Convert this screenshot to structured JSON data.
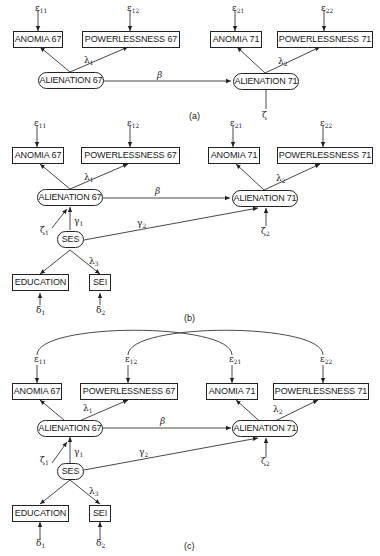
{
  "panels": [
    {
      "id": "a",
      "caption": "(a)",
      "nodes": {
        "anomia67": "ANOMIA 67",
        "powerless67": "POWERLESSNESS 67",
        "anomia71": "ANOMIA 71",
        "powerless71": "POWERLESSNESS 71",
        "alien67": "ALIENATION 67",
        "alien71": "ALIENATION 71"
      },
      "labels": {
        "e11": "ε",
        "e11_sub": "11",
        "e12": "ε",
        "e12_sub": "12",
        "e21": "ε",
        "e21_sub": "21",
        "e22": "ε",
        "e22_sub": "22",
        "lambda1": "λ",
        "lambda1_sub": "1",
        "lambda2": "λ",
        "lambda2_sub": "2",
        "beta": "β",
        "zeta": "ζ"
      }
    },
    {
      "id": "b",
      "caption": "(b)",
      "nodes": {
        "anomia67": "ANOMIA 67",
        "powerless67": "POWERLESSNESS 67",
        "anomia71": "ANOMIA 71",
        "powerless71": "POWERLESSNESS 71",
        "alien67": "ALIENATION 67",
        "alien71": "ALIENATION 71",
        "ses": "SES",
        "education": "EDUCATION",
        "sei": "SEI"
      },
      "labels": {
        "e11": "ε",
        "e11_sub": "11",
        "e12": "ε",
        "e12_sub": "12",
        "e21": "ε",
        "e21_sub": "21",
        "e22": "ε",
        "e22_sub": "22",
        "lambda1": "λ",
        "lambda1_sub": "1",
        "lambda2": "λ",
        "lambda2_sub": "2",
        "lambda3": "λ",
        "lambda3_sub": "3",
        "beta": "β",
        "gamma1": "γ",
        "gamma1_sub": "1",
        "gamma2": "γ",
        "gamma2_sub": "2",
        "zeta1": "ζ",
        "zeta1_sub": "1",
        "zeta2": "ζ",
        "zeta2_sub": "2",
        "delta1": "δ",
        "delta1_sub": "1",
        "delta2": "δ",
        "delta2_sub": "2"
      }
    },
    {
      "id": "c",
      "caption": "(c)",
      "nodes": {
        "anomia67": "ANOMIA 67",
        "powerless67": "POWERLESSNESS 67",
        "anomia71": "ANOMIA 71",
        "powerless71": "POWERLESSNESS 71",
        "alien67": "ALIENATION 67",
        "alien71": "ALIENATION 71",
        "ses": "SES",
        "education": "EDUCATION",
        "sei": "SEI"
      },
      "labels": {
        "e11": "ε",
        "e11_sub": "11",
        "e12": "ε",
        "e12_sub": "12",
        "e21": "ε",
        "e21_sub": "21",
        "e22": "ε",
        "e22_sub": "22",
        "lambda1": "λ",
        "lambda1_sub": "1",
        "lambda2": "λ",
        "lambda2_sub": "2",
        "lambda3": "λ",
        "lambda3_sub": "3",
        "beta": "β",
        "gamma1": "γ",
        "gamma1_sub": "1",
        "gamma2": "γ",
        "gamma2_sub": "2",
        "zeta1": "ζ",
        "zeta1_sub": "1",
        "zeta2": "ζ",
        "zeta2_sub": "2",
        "delta1": "δ",
        "delta1_sub": "1",
        "delta2": "δ",
        "delta2_sub": "2"
      }
    }
  ]
}
